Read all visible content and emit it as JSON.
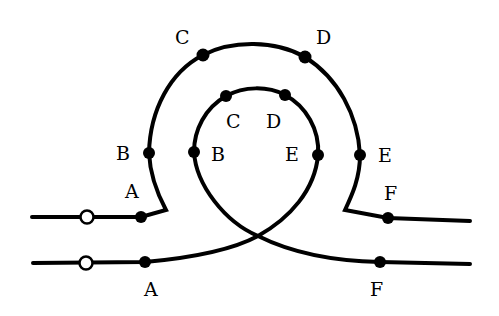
{
  "diagram": {
    "colors": {
      "stroke": "#000000",
      "background": "#ffffff",
      "open_marker_fill": "#ffffff"
    },
    "outer_loop": {
      "labels": {
        "A": "A",
        "B": "B",
        "C": "C",
        "D": "D",
        "E": "E",
        "F": "F"
      }
    },
    "inner_loop": {
      "labels": {
        "A": "A",
        "B": "B",
        "C": "C",
        "D": "D",
        "E": "E",
        "F": "F"
      }
    },
    "start_markers": [
      "open-circle",
      "open-circle"
    ]
  }
}
